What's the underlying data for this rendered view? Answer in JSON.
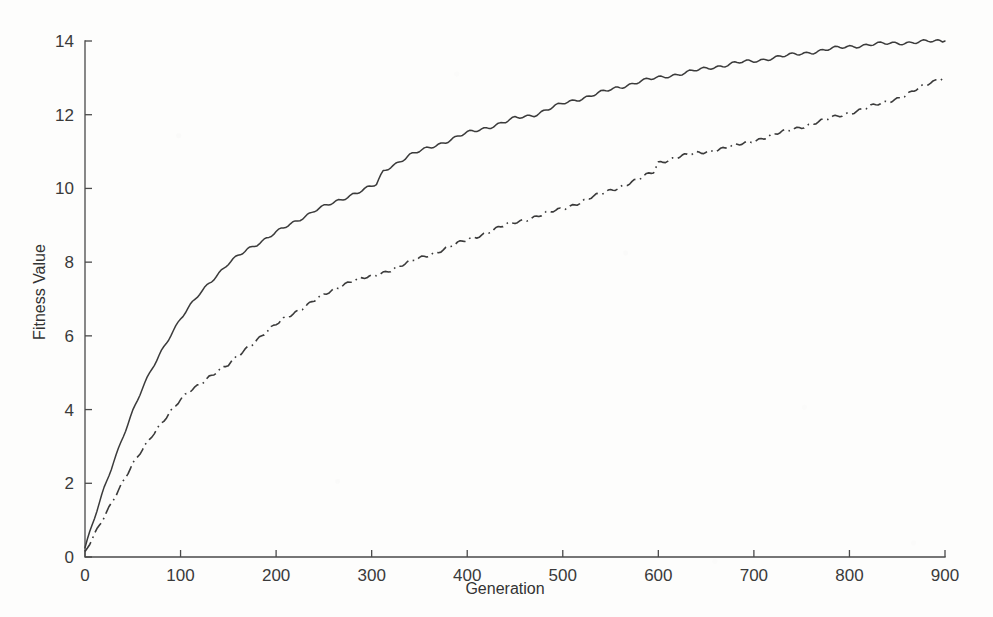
{
  "chart_data": {
    "type": "line",
    "title": "",
    "subtitle": "",
    "xlabel": "Generation",
    "ylabel": "Fitness Value",
    "xlim": [
      0,
      900
    ],
    "ylim": [
      0,
      14
    ],
    "xticks": [
      0,
      100,
      200,
      300,
      400,
      500,
      600,
      700,
      800,
      900
    ],
    "xticklabels": [
      "0",
      "100",
      "200",
      "300",
      "400",
      "500",
      "600",
      "700",
      "800",
      "900"
    ],
    "yticks": [
      0,
      2,
      4,
      6,
      8,
      10,
      12,
      14
    ],
    "yticklabels": [
      "0",
      "2",
      "4",
      "6",
      "8",
      "10",
      "12",
      "14"
    ],
    "grid": false,
    "legend": null,
    "legend_position": "none",
    "axis_style": "left-and-bottom-only",
    "line_color": "#3b3b3b",
    "background_color": "#fdfdfc",
    "series": [
      {
        "name": "solid-curve",
        "linestyle": "solid",
        "x": [
          0,
          10,
          20,
          30,
          40,
          50,
          60,
          70,
          80,
          90,
          100,
          110,
          120,
          130,
          140,
          150,
          160,
          170,
          180,
          190,
          200,
          210,
          220,
          230,
          240,
          250,
          260,
          270,
          280,
          290,
          300,
          305,
          312,
          320,
          330,
          340,
          350,
          360,
          370,
          380,
          390,
          400,
          420,
          440,
          450,
          460,
          470,
          480,
          500,
          520,
          540,
          560,
          580,
          600,
          620,
          640,
          660,
          680,
          700,
          720,
          740,
          760,
          780,
          800,
          820,
          840,
          860,
          880,
          900
        ],
        "y": [
          0.25,
          1.05,
          1.85,
          2.6,
          3.3,
          3.95,
          4.55,
          5.1,
          5.6,
          6.05,
          6.45,
          6.8,
          7.15,
          7.45,
          7.7,
          7.95,
          8.15,
          8.35,
          8.5,
          8.65,
          8.8,
          8.95,
          9.1,
          9.25,
          9.4,
          9.5,
          9.6,
          9.72,
          9.85,
          9.95,
          10.05,
          10.1,
          10.45,
          10.6,
          10.75,
          10.9,
          11.0,
          11.1,
          11.2,
          11.3,
          11.4,
          11.5,
          11.65,
          11.8,
          11.9,
          11.95,
          12.0,
          12.1,
          12.3,
          12.45,
          12.6,
          12.75,
          12.9,
          13.0,
          13.1,
          13.2,
          13.3,
          13.4,
          13.45,
          13.55,
          13.62,
          13.7,
          13.78,
          13.85,
          13.9,
          13.93,
          13.96,
          13.98,
          14.0
        ]
      },
      {
        "name": "dash-dot-curve",
        "linestyle": "dashdot",
        "x": [
          0,
          10,
          20,
          30,
          40,
          50,
          60,
          70,
          80,
          90,
          100,
          110,
          120,
          130,
          140,
          150,
          160,
          170,
          180,
          190,
          200,
          210,
          220,
          230,
          240,
          250,
          260,
          270,
          280,
          290,
          300,
          310,
          320,
          330,
          340,
          350,
          360,
          380,
          400,
          420,
          440,
          460,
          480,
          500,
          520,
          540,
          560,
          580,
          595,
          600,
          610,
          620,
          640,
          660,
          680,
          700,
          720,
          740,
          760,
          780,
          800,
          820,
          840,
          860,
          880,
          900
        ],
        "y": [
          0.1,
          0.6,
          1.1,
          1.6,
          2.05,
          2.5,
          2.9,
          3.3,
          3.65,
          3.95,
          4.25,
          4.5,
          4.7,
          4.9,
          5.05,
          5.2,
          5.45,
          5.7,
          5.9,
          6.1,
          6.3,
          6.5,
          6.65,
          6.8,
          6.95,
          7.1,
          7.25,
          7.4,
          7.5,
          7.55,
          7.6,
          7.7,
          7.8,
          7.9,
          8.0,
          8.1,
          8.2,
          8.4,
          8.6,
          8.8,
          9.0,
          9.15,
          9.3,
          9.45,
          9.65,
          9.85,
          10.05,
          10.25,
          10.45,
          10.7,
          10.78,
          10.85,
          10.95,
          11.05,
          11.15,
          11.3,
          11.45,
          11.6,
          11.75,
          11.9,
          12.05,
          12.2,
          12.35,
          12.55,
          12.8,
          13.05
        ]
      }
    ]
  },
  "figure": {
    "plot_area": {
      "left": 85,
      "right": 945,
      "top": 41,
      "bottom": 557
    }
  }
}
